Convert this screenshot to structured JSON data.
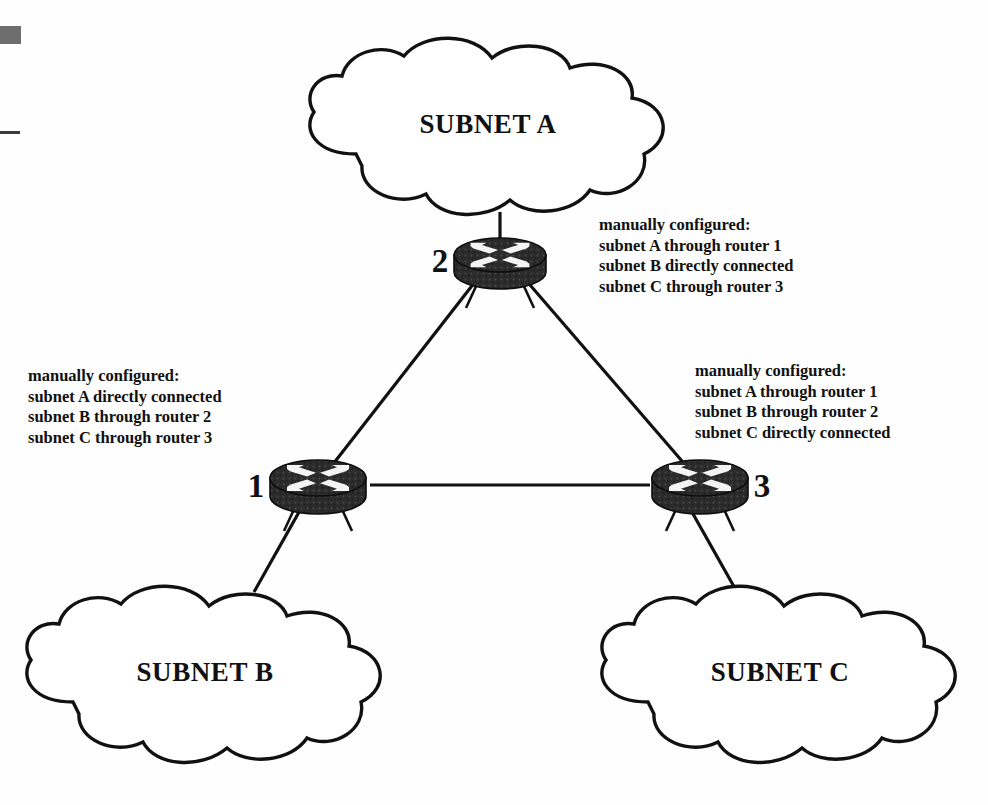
{
  "diagram": {
    "background_color": "#ffffff",
    "line_color": "#111111",
    "router_body_color": "#2b2b2b",
    "clouds": [
      {
        "id": "subnet-a",
        "label": "SUBNET A",
        "cx": 488,
        "cy": 125
      },
      {
        "id": "subnet-b",
        "label": "SUBNET B",
        "cx": 205,
        "cy": 672
      },
      {
        "id": "subnet-c",
        "label": "SUBNET C",
        "cx": 780,
        "cy": 672
      }
    ],
    "routers": [
      {
        "id": "router-2",
        "number": "2",
        "cx": 500,
        "cy": 260,
        "label_x": 440,
        "label_y": 272
      },
      {
        "id": "router-1",
        "number": "1",
        "cx": 318,
        "cy": 483,
        "label_x": 256,
        "label_y": 497
      },
      {
        "id": "router-3",
        "number": "3",
        "cx": 700,
        "cy": 483,
        "label_x": 762,
        "label_y": 497
      }
    ],
    "links": [
      {
        "id": "link-router1-router2",
        "from": "router-1",
        "to": "router-2"
      },
      {
        "id": "link-router2-router3",
        "from": "router-2",
        "to": "router-3"
      },
      {
        "id": "link-router1-router3",
        "from": "router-1",
        "to": "router-3"
      },
      {
        "id": "link-router2-subnet-a",
        "from": "router-2",
        "to": "subnet-a"
      },
      {
        "id": "link-router1-subnet-b",
        "from": "router-1",
        "to": "subnet-b"
      },
      {
        "id": "link-router3-subnet-c",
        "from": "router-3",
        "to": "subnet-c"
      }
    ],
    "annotations": [
      {
        "id": "annotation-router-2",
        "for_router": "2",
        "x": 599,
        "y": 215,
        "lines": [
          "manually configured:",
          "subnet A through router 1",
          "subnet B directly connected",
          "subnet C through router 3"
        ]
      },
      {
        "id": "annotation-router-1",
        "for_router": "1",
        "x": 28,
        "y": 366,
        "lines": [
          "manually configured:",
          "subnet A directly connected",
          "subnet B through router 2",
          "subnet C through router 3"
        ]
      },
      {
        "id": "annotation-router-3",
        "for_router": "3",
        "x": 695,
        "y": 361,
        "lines": [
          "manually configured:",
          "subnet A through router 1",
          "subnet B through router 2",
          "subnet C directly connected"
        ]
      }
    ],
    "artifacts": [
      {
        "id": "scan-blob",
        "color": "#6e6e6e"
      },
      {
        "id": "scan-line",
        "color": "#3a3a3a"
      }
    ]
  }
}
